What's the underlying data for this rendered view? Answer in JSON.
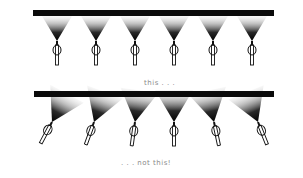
{
  "figure": {
    "type": "illustration",
    "colors": {
      "pipe": "#0a0a0a",
      "spray_dark": "#000000",
      "spray_light": "#ffffff",
      "nozzle_stroke": "#111111",
      "caption": "#8a8a8a"
    }
  },
  "panels": [
    {
      "id": "correct",
      "caption": "this . . .",
      "pipe": {
        "x1": 33,
        "x2": 274,
        "y": 10,
        "thickness": 6
      },
      "nozzles": [
        {
          "x": 57,
          "tilt_deg": 0
        },
        {
          "x": 96,
          "tilt_deg": 0
        },
        {
          "x": 135,
          "tilt_deg": 0
        },
        {
          "x": 174,
          "tilt_deg": 0
        },
        {
          "x": 213,
          "tilt_deg": 0
        },
        {
          "x": 252,
          "tilt_deg": 0
        }
      ]
    },
    {
      "id": "incorrect",
      "caption": ". . . not this!",
      "pipe": {
        "x1": 34,
        "x2": 274,
        "y": 91,
        "thickness": 6
      },
      "nozzles": [
        {
          "x": 52,
          "tilt_deg": 28
        },
        {
          "x": 94,
          "tilt_deg": 20
        },
        {
          "x": 135,
          "tilt_deg": 8
        },
        {
          "x": 174,
          "tilt_deg": 0
        },
        {
          "x": 214,
          "tilt_deg": -12
        },
        {
          "x": 258,
          "tilt_deg": -22
        }
      ]
    }
  ]
}
